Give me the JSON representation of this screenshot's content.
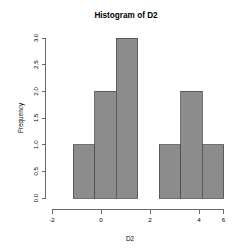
{
  "chart_data": {
    "type": "bar",
    "title": "Histogram of D2",
    "xlabel": "D2",
    "ylabel": "Frequency",
    "categories": [
      "[-1,0)",
      "[0,1)",
      "[1,2)",
      "[2,3)",
      "[3,4)",
      "[4,5)",
      "[5,6)"
    ],
    "bin_edges": [
      -1,
      0,
      1,
      2,
      3,
      4,
      5,
      6
    ],
    "values": [
      1,
      2,
      3,
      0,
      1,
      2,
      1
    ],
    "bin_width": 1,
    "xlim": [
      -2,
      6
    ],
    "ylim": [
      0,
      3
    ],
    "xticks": [
      -2,
      0,
      2,
      4,
      6
    ],
    "xtick_labels": [
      "-2",
      "0",
      "2",
      "4",
      "6"
    ],
    "yticks": [
      0.0,
      0.5,
      1.0,
      1.5,
      2.0,
      2.5,
      3.0
    ],
    "ytick_labels": [
      "0.0",
      "0.5",
      "1.0",
      "1.5",
      "2.0",
      "2.5",
      "3.0"
    ],
    "grid": false,
    "legend": false,
    "bar_fill_color": "#8c8c8c",
    "bar_border_color": "#4d4d4d",
    "axis_color": "#595959",
    "background_color": "#ffffff"
  }
}
